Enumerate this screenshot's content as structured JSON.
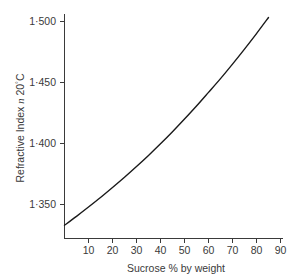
{
  "chart_data": {
    "type": "line",
    "title": "",
    "xlabel": "Sucrose % by weight",
    "ylabel": "Refractive Index n 20°C",
    "ylabel_parts": {
      "lead": "Refractive Index ",
      "italic": "n",
      "trail": " 20",
      "degree": "°",
      "unit": "C"
    },
    "xlim": [
      0,
      92
    ],
    "ylim": [
      1.3325,
      1.5075
    ],
    "grid": false,
    "legend": false,
    "xticks": [
      10,
      20,
      30,
      40,
      50,
      60,
      70,
      80,
      90
    ],
    "xtick_labels": [
      "10",
      "20",
      "30",
      "40",
      "50",
      "60",
      "70",
      "80",
      "90"
    ],
    "yticks": [
      1.35,
      1.4,
      1.45,
      1.5
    ],
    "ytick_labels": [
      "1·350",
      "1·400",
      "1·450",
      "1·500"
    ],
    "series": [
      {
        "name": "Refractive index of sucrose solution",
        "color": "#1a1a1a",
        "x": [
          0,
          5,
          10,
          15,
          20,
          25,
          30,
          35,
          40,
          45,
          50,
          55,
          60,
          65,
          70,
          75,
          80,
          85
        ],
        "y": [
          1.333,
          1.3403,
          1.3479,
          1.3557,
          1.3639,
          1.3723,
          1.3811,
          1.3902,
          1.3997,
          1.4096,
          1.42,
          1.4307,
          1.4419,
          1.4532,
          1.4651,
          1.4774,
          1.4901,
          1.5033
        ]
      }
    ],
    "annotations": []
  },
  "figure": {
    "background_color": "#ffffff",
    "axis_color": "#3a3a3a",
    "curve_color": "#1a1a1a"
  }
}
